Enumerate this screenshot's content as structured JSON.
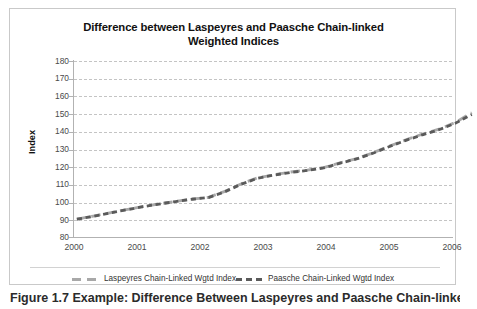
{
  "figure": {
    "caption": "Figure 1.7 Example: Difference Between Laspeyres and Paasche Chain-linked"
  },
  "chart": {
    "title": "Difference between Laspeyres and Paasche Chain-linked Weighted Indices",
    "title_line1": "Difference between Laspeyres and Paasche Chain-linked",
    "title_line2": "Weighted Indices",
    "ylabel": "Index",
    "xlabel": "",
    "ytick_labels": [
      "180",
      "170",
      "160",
      "150",
      "140",
      "130",
      "120",
      "110",
      "100",
      "90",
      "80"
    ],
    "xtick_labels": [
      "2000",
      "2001",
      "2002",
      "2003",
      "2004",
      "2005",
      "2006"
    ],
    "legend": {
      "laspeyres_label": "Laspeyres Chain-Linked Wgtd Index",
      "paasche_label": "Paasche Chain-Linked Wgtd Index"
    },
    "colors": {
      "laspeyres": "#a8a8a8",
      "paasche": "#5a5a5a",
      "gridline": "#c4c4c4",
      "axis": "#b2b2b2",
      "border": "#c9c9c9",
      "background": "#ffffff",
      "text": "#4a4a4a",
      "title_text": "#111111"
    }
  },
  "chart_data": {
    "type": "line",
    "title": "Difference between Laspeyres and Paasche Chain-linked Weighted Indices",
    "xlabel": "",
    "ylabel": "Index",
    "xlim": [
      2000,
      2006
    ],
    "ylim": [
      80,
      180
    ],
    "ytick_values": [
      80,
      90,
      100,
      110,
      120,
      130,
      140,
      150,
      160,
      170,
      180
    ],
    "xtick_values": [
      2000,
      2001,
      2002,
      2003,
      2004,
      2005,
      2006
    ],
    "grid": "horizontal-dashed",
    "legend_position": "bottom",
    "x": [
      2000,
      2000.25,
      2000.5,
      2000.75,
      2001,
      2001.25,
      2001.5,
      2001.75,
      2002,
      2002.25,
      2002.5,
      2002.75,
      2003,
      2003.25,
      2003.5,
      2003.75,
      2004,
      2004.25,
      2004.5,
      2004.75,
      2005,
      2005.25,
      2005.5,
      2005.75,
      2006
    ],
    "series": [
      {
        "name": "Laspeyres Chain-Linked Wgtd Index",
        "color": "#a8a8a8",
        "dash": "long",
        "values": [
          100.0,
          101.6,
          103.3,
          105.0,
          106.6,
          108.0,
          109.3,
          110.5,
          111.4,
          114.5,
          118.5,
          121.6,
          123.2,
          124.6,
          125.6,
          126.9,
          129.4,
          131.6,
          134.6,
          138.1,
          141.4,
          144.3,
          146.9,
          150.4,
          155.5
        ]
      },
      {
        "name": "Paasche Chain-Linked Wgtd Index",
        "color": "#5a5a5a",
        "dash": "short",
        "values": [
          100.0,
          101.5,
          103.2,
          104.9,
          106.5,
          107.9,
          109.2,
          110.4,
          111.3,
          114.3,
          118.3,
          121.4,
          123.0,
          124.4,
          125.4,
          126.7,
          129.2,
          131.4,
          134.4,
          137.9,
          141.1,
          144.0,
          146.6,
          150.0,
          154.6
        ]
      }
    ]
  }
}
